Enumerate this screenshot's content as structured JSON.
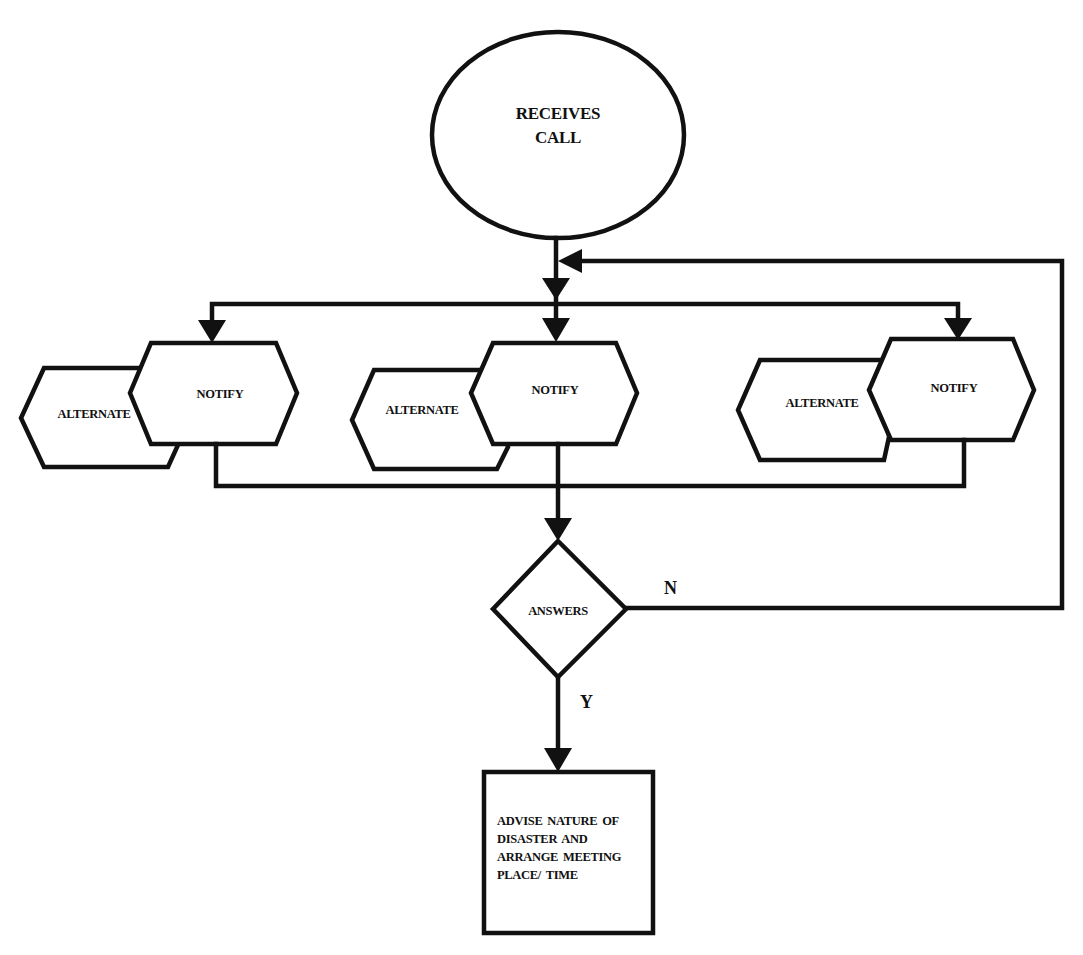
{
  "diagram": {
    "type": "flowchart",
    "colors": {
      "stroke": "#111111",
      "background": "#ffffff"
    },
    "nodes": {
      "start": {
        "shape": "ellipse",
        "lines": [
          "RECEIVES",
          "CALL"
        ]
      },
      "groups": [
        {
          "notify": "NOTIFY",
          "alternate": "ALTERNATE"
        },
        {
          "notify": "NOTIFY",
          "alternate": "ALTERNATE"
        },
        {
          "notify": "NOTIFY",
          "alternate": "ALTERNATE"
        }
      ],
      "decision": {
        "shape": "diamond",
        "label": "ANSWERS"
      },
      "end": {
        "shape": "rectangle",
        "lines": [
          "ADVISE NATURE OF",
          "DISASTER AND",
          "ARRANGE MEETING",
          "PLACE/ TIME"
        ]
      }
    },
    "edges": {
      "no_label": "N",
      "yes_label": "Y"
    }
  }
}
